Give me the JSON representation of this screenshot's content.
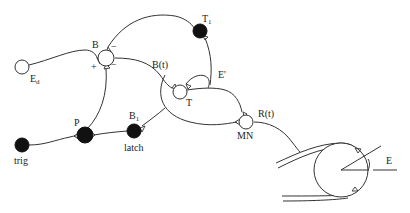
{
  "diagram": {
    "type": "neural-circuit",
    "nodes": {
      "Ed": {
        "label": "E",
        "sub": "d",
        "style": "open"
      },
      "B": {
        "label": "B",
        "style": "open",
        "signs": [
          "+",
          "−",
          "−"
        ]
      },
      "T1": {
        "label": "T",
        "sub": "1",
        "style": "filled"
      },
      "Bt": {
        "label": "B(t)"
      },
      "Eprime": {
        "label": "E'"
      },
      "T": {
        "label": "T",
        "style": "open"
      },
      "MN": {
        "label": "MN",
        "style": "open"
      },
      "Rt": {
        "label": "R(t)"
      },
      "trig": {
        "label": "trig",
        "style": "filled"
      },
      "P": {
        "label": "P",
        "style": "filled"
      },
      "B1": {
        "label": "B",
        "sub": "1",
        "style": "filled"
      },
      "latch": {
        "label": "latch"
      },
      "E": {
        "label": "E"
      }
    },
    "colors": {
      "line": "#333333",
      "filled": "#111111",
      "background": "#ffffff"
    }
  }
}
